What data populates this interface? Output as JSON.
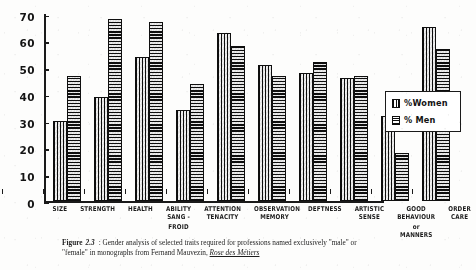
{
  "chart_data": {
    "type": "bar",
    "title": "",
    "xlabel": "",
    "ylabel": "",
    "ylim": [
      0,
      70
    ],
    "yticks": [
      0,
      10,
      20,
      30,
      40,
      50,
      60,
      70
    ],
    "grid": false,
    "legend_position": "right",
    "categories": [
      "SIZE",
      "STRENGTH",
      "HEALTH",
      "ABILITY SANG-FROID",
      "ATTENTION TENACITY",
      "OBSERVATION MEMORY",
      "DEFTNESS",
      "ARTISTIC SENSE",
      "GOOD BEHAVIOUR OR MANNERS",
      "ORDER CARE"
    ],
    "category_label_lines": [
      [
        "SIZE"
      ],
      [
        "STRENGTH"
      ],
      [
        "HEALTH"
      ],
      [
        "ABILITY",
        "SANG -",
        "FROID"
      ],
      [
        "ATTENTION",
        "TENACITY"
      ],
      [
        "OBSERVATION",
        "MEMORY"
      ],
      [
        "DEFTNESS"
      ],
      [
        "ARTISTIC",
        "SENSE"
      ],
      [
        "GOOD",
        "BEHAVIOUR",
        "or",
        "MANNERS"
      ],
      [
        "ORDER",
        "CARE"
      ]
    ],
    "series": [
      {
        "name": "% Women",
        "pattern": "vertical-hatch",
        "values": [
          30,
          39,
          54,
          34,
          63,
          51,
          48,
          46,
          32,
          65
        ]
      },
      {
        "name": "% Men",
        "pattern": "horizontal-hatch",
        "values": [
          47,
          68,
          67,
          44,
          58,
          47,
          52,
          47,
          18,
          57
        ]
      }
    ]
  },
  "legend": {
    "entries": [
      {
        "label": "%Women",
        "swatch": "vertical-hatch-swatch"
      },
      {
        "label": "% Men",
        "swatch": "horizontal-hatch-swatch"
      }
    ]
  },
  "caption": {
    "figure_word": "Figure",
    "figure_number": "2.3",
    "line1": ": Gender analysis of selected traits required for professions named exclusively \"male\" or",
    "line2_prefix": "\"female\" in monographs from Fernand Mauvezin,",
    "reference": "Rose des Métiers"
  }
}
